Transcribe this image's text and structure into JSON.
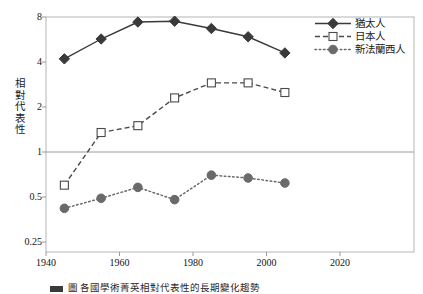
{
  "chart_data": {
    "type": "line",
    "title": "",
    "xlabel": "",
    "ylabel": "相對代表性",
    "xlim": [
      1940,
      2030
    ],
    "ylim": [
      0.25,
      8
    ],
    "yscale": "log",
    "yticks": [
      "8",
      "4",
      "2",
      "1",
      "0.5",
      "0.25"
    ],
    "ytick_values": [
      8,
      4,
      2,
      1,
      0.5,
      0.25
    ],
    "xticks": [
      "1940",
      "1960",
      "1980",
      "2000",
      "2020"
    ],
    "xtick_values": [
      1940,
      1960,
      1980,
      2000,
      2020
    ],
    "grid": false,
    "reference_line": 1,
    "legend_position": "top-right",
    "x": [
      1945,
      1955,
      1965,
      1975,
      1985,
      1995,
      2005
    ],
    "series": [
      {
        "name": "猶太人",
        "marker": "filled-diamond",
        "line": "solid",
        "color": "#3a3a3a",
        "values": [
          4.2,
          5.7,
          7.4,
          7.5,
          6.7,
          5.9,
          4.6
        ]
      },
      {
        "name": "日本人",
        "marker": "open-square",
        "line": "dashed",
        "color": "#4a4a4a",
        "values": [
          0.6,
          1.35,
          1.5,
          2.3,
          2.9,
          2.9,
          2.5
        ]
      },
      {
        "name": "新法蘭西人",
        "marker": "filled-circle",
        "line": "dotted",
        "color": "#6a6a6a",
        "values": [
          0.42,
          0.49,
          0.58,
          0.48,
          0.7,
          0.67,
          0.62
        ]
      }
    ]
  },
  "axes": {
    "y_title": "相對代表性",
    "y_tick_labels": [
      "8",
      "4",
      "2",
      "1",
      "0.5",
      "0.25"
    ],
    "x_tick_labels": [
      "1940",
      "1960",
      "1980",
      "2000",
      "2020"
    ]
  },
  "legend": {
    "items": [
      {
        "label": "猶太人"
      },
      {
        "label": "日本人"
      },
      {
        "label": "新法蘭西人"
      }
    ]
  },
  "caption": {
    "text": "圖     各國學術菁英相對代表性的長期變化趨勢"
  },
  "colors": {
    "axis": "#9a9a9a",
    "frame": "#b5b5b5",
    "reference_line": "#9a9a9a",
    "series_1": "#3a3a3a",
    "series_2": "#4a4a4a",
    "series_3": "#6a6a6a",
    "text": "#1c1c1c",
    "background": "#ffffff"
  }
}
